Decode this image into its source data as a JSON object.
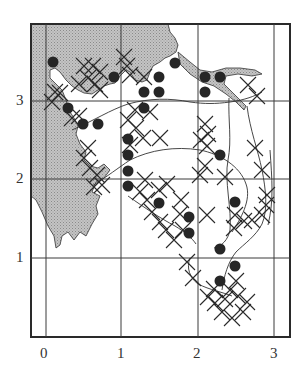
{
  "figure": {
    "type": "grid distribution map",
    "x_axis": {
      "ticks": [
        "0",
        "1",
        "2",
        "3"
      ]
    },
    "y_axis": {
      "ticks": [
        "1",
        "2",
        "3"
      ]
    },
    "legend": {
      "dot": "filled-circle-marker",
      "cross": "x-marker",
      "shade": "stippled-landmass"
    }
  },
  "colors": {
    "ink": "#2a2a2a",
    "shade": "#bdbdbd",
    "background": "#ffffff"
  },
  "geometry": {
    "frame": {
      "left": 31,
      "top": 24,
      "right": 290,
      "bottom": 337
    },
    "grid_x_px": [
      46,
      121,
      198,
      274
    ],
    "grid_y_px": [
      101,
      179,
      258
    ]
  },
  "markers": {
    "dots": [
      [
        53,
        62
      ],
      [
        68,
        108
      ],
      [
        83,
        124
      ],
      [
        98,
        124
      ],
      [
        114,
        77
      ],
      [
        144,
        92
      ],
      [
        159,
        92
      ],
      [
        159,
        77
      ],
      [
        175,
        63
      ],
      [
        144,
        108
      ],
      [
        205,
        77
      ],
      [
        220,
        77
      ],
      [
        205,
        92
      ],
      [
        128,
        139
      ],
      [
        128,
        155
      ],
      [
        128,
        171
      ],
      [
        128,
        186
      ],
      [
        159,
        203
      ],
      [
        189,
        217
      ],
      [
        189,
        233
      ],
      [
        220,
        155
      ],
      [
        235,
        202
      ],
      [
        220,
        249
      ],
      [
        235,
        266
      ],
      [
        220,
        281
      ]
    ],
    "crosses": [
      [
        84,
        66
      ],
      [
        93,
        66
      ],
      [
        100,
        72
      ],
      [
        88,
        78
      ],
      [
        95,
        84
      ],
      [
        100,
        90
      ],
      [
        79,
        84
      ],
      [
        60,
        93
      ],
      [
        52,
        102
      ],
      [
        55,
        92
      ],
      [
        127,
        66
      ],
      [
        124,
        57
      ],
      [
        130,
        75
      ],
      [
        144,
        77
      ],
      [
        79,
        116
      ],
      [
        72,
        118
      ],
      [
        88,
        148
      ],
      [
        84,
        158
      ],
      [
        90,
        168
      ],
      [
        97,
        175
      ],
      [
        102,
        185
      ],
      [
        94,
        187
      ],
      [
        135,
        110
      ],
      [
        128,
        120
      ],
      [
        136,
        128
      ],
      [
        143,
        138
      ],
      [
        130,
        145
      ],
      [
        150,
        112
      ],
      [
        160,
        138
      ],
      [
        145,
        180
      ],
      [
        140,
        192
      ],
      [
        147,
        200
      ],
      [
        152,
        212
      ],
      [
        160,
        222
      ],
      [
        166,
        230
      ],
      [
        174,
        240
      ],
      [
        183,
        230
      ],
      [
        180,
        214
      ],
      [
        159,
        190
      ],
      [
        167,
        184
      ],
      [
        181,
        200
      ],
      [
        205,
        124
      ],
      [
        208,
        134
      ],
      [
        201,
        140
      ],
      [
        207,
        146
      ],
      [
        205,
        166
      ],
      [
        200,
        175
      ],
      [
        207,
        215
      ],
      [
        225,
        177
      ],
      [
        235,
        215
      ],
      [
        255,
        148
      ],
      [
        262,
        170
      ],
      [
        267,
        195
      ],
      [
        266,
        205
      ],
      [
        262,
        215
      ],
      [
        252,
        220
      ],
      [
        244,
        221
      ],
      [
        234,
        228
      ],
      [
        257,
        96
      ],
      [
        248,
        85
      ],
      [
        187,
        262
      ],
      [
        193,
        278
      ],
      [
        208,
        297
      ],
      [
        215,
        303
      ],
      [
        222,
        312
      ],
      [
        232,
        318
      ],
      [
        243,
        312
      ],
      [
        247,
        302
      ],
      [
        238,
        296
      ],
      [
        230,
        290
      ],
      [
        225,
        299
      ],
      [
        214,
        289
      ],
      [
        236,
        281
      ]
    ]
  }
}
